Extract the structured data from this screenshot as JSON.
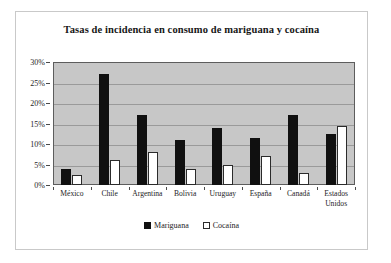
{
  "chart_data": {
    "type": "bar",
    "title": "Tasas de incidencia en consumo de mariguana y cocaína",
    "xlabel": "",
    "ylabel": "",
    "categories": [
      "México",
      "Chile",
      "Argentina",
      "Bolivia",
      "Uruguay",
      "España",
      "Canadá",
      "Estados Unidos"
    ],
    "series": [
      {
        "name": "Mariguana",
        "color": "#101010",
        "values": [
          4,
          27,
          17,
          11,
          14,
          11.5,
          17,
          12.5
        ]
      },
      {
        "name": "Cocaína",
        "color": "#ffffff",
        "values": [
          2.5,
          6,
          8,
          4,
          5,
          7,
          3,
          14.5
        ]
      }
    ],
    "ylim": [
      0,
      30
    ],
    "ytick_values": [
      0,
      5,
      10,
      15,
      20,
      25,
      30
    ],
    "ytick_labels": [
      "0%",
      "5%",
      "10%",
      "15%",
      "20%",
      "25%",
      "30%"
    ],
    "grid": true,
    "grid_axis": "y",
    "legend_position": "bottom",
    "plot_background": "#c7c7c7",
    "figure_background": "#ffffff"
  }
}
